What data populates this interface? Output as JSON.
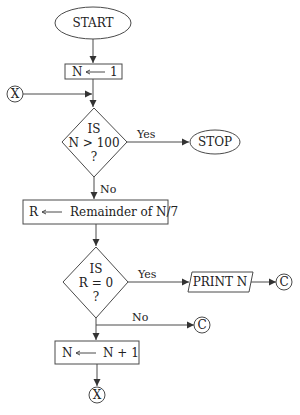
{
  "flowchart": {
    "start": {
      "label": "START"
    },
    "init": {
      "left": "N",
      "right": "1"
    },
    "connector_x_in": {
      "label": "X"
    },
    "decision1": {
      "line1": "IS",
      "line2": "N > 100",
      "line3": "?",
      "yes_label": "Yes",
      "no_label": "No"
    },
    "stop": {
      "label": "STOP"
    },
    "remainder": {
      "left": "R",
      "right": "Remainder of N/7"
    },
    "decision2": {
      "line1": "IS",
      "line2": "R = 0",
      "line3": "?",
      "yes_label": "Yes",
      "no_label": "No"
    },
    "print": {
      "label": "PRINT N"
    },
    "connector_c_yes": {
      "label": "C"
    },
    "connector_c_no": {
      "label": "C"
    },
    "increment": {
      "left": "N",
      "right": "N + 1"
    },
    "connector_x_out": {
      "label": "X"
    }
  },
  "colors": {
    "stroke": "#4a4a4a",
    "text": "#222222",
    "background": "#ffffff"
  }
}
